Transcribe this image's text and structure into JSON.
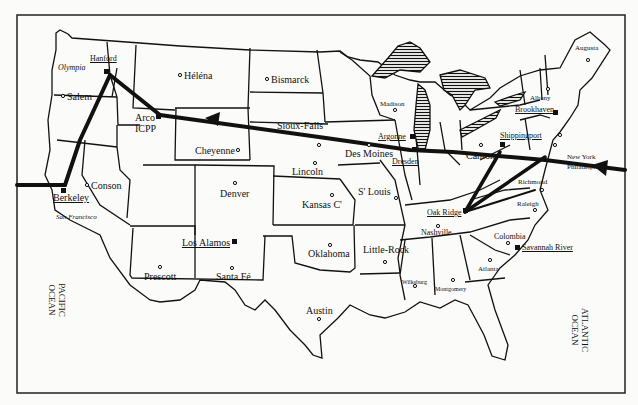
{
  "map": {
    "title": "United States map of nuclear sites and transport routes",
    "oceans": [
      {
        "id": "pacific",
        "label": "PACIFIC\nOCEAN"
      },
      {
        "id": "atlantic",
        "label": "ATLANTIC\nOCEAN"
      }
    ],
    "cities": [
      {
        "id": "olympia",
        "label": "Olympia",
        "style": "italic"
      },
      {
        "id": "salem",
        "label": "Salem"
      },
      {
        "id": "helena",
        "label": "Héléna"
      },
      {
        "id": "bismarck",
        "label": "Bismarck"
      },
      {
        "id": "madison",
        "label": "Madison"
      },
      {
        "id": "augusta",
        "label": "Augusta"
      },
      {
        "id": "albany",
        "label": "Albany"
      },
      {
        "id": "new-york",
        "label": "New York"
      },
      {
        "id": "philadelphia",
        "label": "Philadelphia"
      },
      {
        "id": "sioux-falls",
        "label": "Sioux-Falls"
      },
      {
        "id": "des-moines",
        "label": "Des Moines"
      },
      {
        "id": "cheyenne",
        "label": "Cheyenne"
      },
      {
        "id": "conson",
        "label": "Conson"
      },
      {
        "id": "san-francisco",
        "label": "San Francisco",
        "style": "italic"
      },
      {
        "id": "denver",
        "label": "Denver"
      },
      {
        "id": "lincoln",
        "label": "Lincoln"
      },
      {
        "id": "kansas-city",
        "label": "Kansas C'"
      },
      {
        "id": "st-louis",
        "label": "S' Louis"
      },
      {
        "id": "canton",
        "label": "Canton"
      },
      {
        "id": "richmond",
        "label": "Richmond"
      },
      {
        "id": "raleigh",
        "label": "Raleigh"
      },
      {
        "id": "nashville",
        "label": "Nashville"
      },
      {
        "id": "colombia",
        "label": "Colombia"
      },
      {
        "id": "little-rock",
        "label": "Little-Rock"
      },
      {
        "id": "oklahoma",
        "label": "Oklahoma"
      },
      {
        "id": "prescott",
        "label": "Prescott"
      },
      {
        "id": "santa-fe",
        "label": "Santa Fé"
      },
      {
        "id": "austin",
        "label": "Austin"
      },
      {
        "id": "atlanta",
        "label": "Atlanta"
      },
      {
        "id": "wilksburg",
        "label": "Wilksburg"
      },
      {
        "id": "montgomery",
        "label": "Montgomery"
      }
    ],
    "sites": [
      {
        "id": "hanford",
        "label": "Hanford"
      },
      {
        "id": "arco-icpp",
        "label": "Arco\nICPP"
      },
      {
        "id": "berkeley",
        "label": "Berkeley"
      },
      {
        "id": "los-alamos",
        "label": "Los Alamos"
      },
      {
        "id": "argonne",
        "label": "Argonne"
      },
      {
        "id": "dresden",
        "label": "Dresden"
      },
      {
        "id": "brookhaven",
        "label": "Brookhaven"
      },
      {
        "id": "shippingport",
        "label": "Shippingport"
      },
      {
        "id": "oak-ridge",
        "label": "Oak Ridge"
      },
      {
        "id": "savannah-river",
        "label": "Savannah River"
      }
    ],
    "routes": [
      {
        "id": "atlantic-to-arco",
        "from": "Atlantic",
        "to": "Arco ICPP",
        "via": [
          "Philadelphia",
          "Shippingport",
          "Dresden",
          "Sioux-Falls"
        ]
      },
      {
        "id": "hanford-arco",
        "from": "Hanford",
        "to": "Arco ICPP"
      },
      {
        "id": "hanford-berkeley",
        "from": "Hanford",
        "to": "Berkeley"
      },
      {
        "id": "pacific-to-berkeley",
        "from": "Pacific",
        "to": "Berkeley"
      },
      {
        "id": "oakridge-shippingport",
        "from": "Oak Ridge",
        "to": "Shippingport"
      },
      {
        "id": "oakridge-philadelphia",
        "from": "Oak Ridge",
        "to": "Philadelphia"
      }
    ]
  }
}
